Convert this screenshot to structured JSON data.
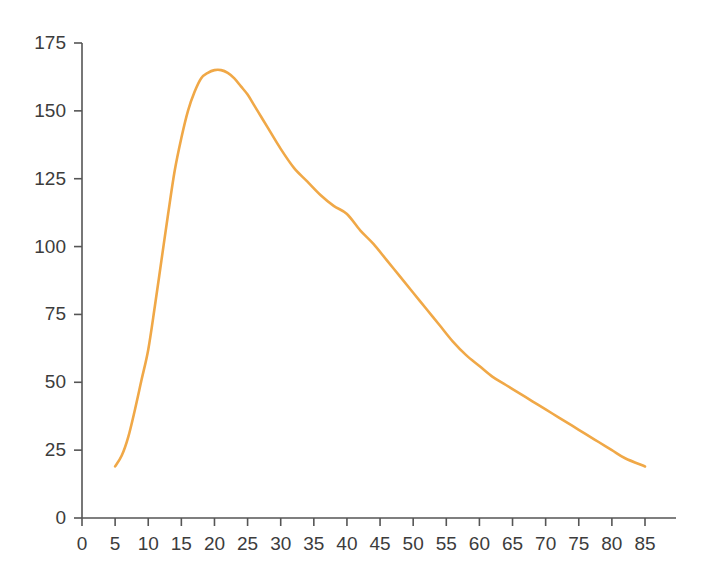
{
  "chart_data": {
    "type": "line",
    "title": "",
    "subtitle": "",
    "xlabel": "",
    "ylabel": "",
    "xlim": [
      0,
      88
    ],
    "ylim": [
      0,
      175
    ],
    "grid": false,
    "legend": null,
    "line_color": "#F0A847",
    "axis_color": "#555555",
    "text_color": "#3c3c3c",
    "background": "#ffffff",
    "x_ticks": [
      0,
      5,
      10,
      15,
      20,
      25,
      30,
      35,
      40,
      45,
      50,
      55,
      60,
      65,
      70,
      75,
      80,
      85
    ],
    "y_ticks": [
      0,
      25,
      50,
      75,
      100,
      125,
      150,
      175
    ],
    "series": [
      {
        "name": "curve",
        "x": [
          5,
          6,
          7,
          8,
          9,
          10,
          11,
          12,
          13,
          14,
          15,
          16,
          17,
          18,
          19,
          20,
          21,
          22,
          23,
          24,
          25,
          26,
          27,
          28,
          30,
          32,
          34,
          36,
          38,
          40,
          42,
          44,
          46,
          48,
          50,
          52,
          54,
          56,
          58,
          60,
          62,
          64,
          66,
          68,
          70,
          72,
          74,
          76,
          78,
          80,
          82,
          85
        ],
        "y": [
          19,
          23,
          30,
          40,
          51,
          62,
          78,
          95,
          112,
          128,
          140,
          150,
          157,
          162,
          164,
          165,
          165,
          164,
          162,
          159,
          156,
          152,
          148,
          144,
          136,
          129,
          124,
          119,
          115,
          112,
          106,
          101,
          95,
          89,
          83,
          77,
          71,
          65,
          60,
          56,
          52,
          49,
          46,
          43,
          40,
          37,
          34,
          31,
          28,
          25,
          22,
          19
        ]
      }
    ]
  },
  "axes": {
    "y_tick_labels": [
      "0",
      "25",
      "50",
      "75",
      "100",
      "125",
      "150",
      "175"
    ],
    "x_tick_labels": [
      "0",
      "5",
      "10",
      "15",
      "20",
      "25",
      "30",
      "35",
      "40",
      "45",
      "50",
      "55",
      "60",
      "65",
      "70",
      "75",
      "80",
      "85"
    ]
  }
}
